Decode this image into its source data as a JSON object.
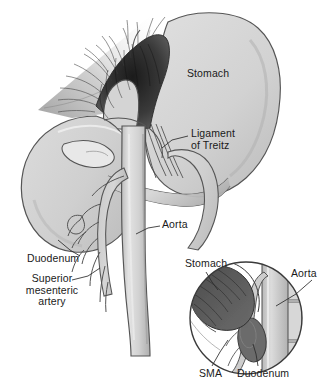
{
  "figure": {
    "width": 332,
    "height": 389,
    "background_color": "#ffffff"
  },
  "palette": {
    "outline": "#4a4a4a",
    "organ_fill_light": "#d9d9d9",
    "organ_fill_mid": "#c9c9c9",
    "organ_fill_dark": "#b5b5b5",
    "vessel_fill": "#cfcfcf",
    "vessel_shadow": "#a9a9a9",
    "inset_dark_stomach": "#595959",
    "inset_dark_duodenum": "#6e6e6e",
    "hatch_line": "#3a3a3a",
    "label_text": "#1a1a1a",
    "leader_line": "#2b2b2b"
  },
  "main_view": {
    "labels": [
      {
        "id": "stomach",
        "text": "Stomach",
        "lines": [
          "Stomach"
        ],
        "x": 187,
        "y": 68,
        "has_leader": false
      },
      {
        "id": "ligament",
        "text": "Ligament of Treitz",
        "lines": [
          "Ligament",
          "of Treitz"
        ],
        "x": 191,
        "y": 128,
        "has_leader": true
      },
      {
        "id": "aorta",
        "text": "Aorta",
        "lines": [
          "Aorta"
        ],
        "x": 162,
        "y": 219,
        "has_leader": true
      },
      {
        "id": "duodenum",
        "text": "Duodenum",
        "lines": [
          "Duodenum"
        ],
        "x": 27,
        "y": 253,
        "has_leader": true
      },
      {
        "id": "sma",
        "text": "Superior mesenteric artery",
        "lines": [
          "Superior",
          "mesenteric",
          "artery"
        ],
        "x": 21,
        "y": 273,
        "has_leader": true
      }
    ],
    "structures": [
      "stomach",
      "esophagus",
      "diaphragm-crus",
      "esophageal-hiatus",
      "duodenum",
      "aorta",
      "superior-mesenteric-artery",
      "ligament-of-treitz-fibers"
    ]
  },
  "inset_view": {
    "shape": "circle",
    "center_x": 246,
    "center_y": 318,
    "radius": 57,
    "labels": [
      {
        "id": "stomach",
        "text": "Stomach",
        "x": 185,
        "y": 258,
        "has_leader": true
      },
      {
        "id": "aorta",
        "text": "Aorta",
        "x": 291,
        "y": 268,
        "has_leader": true
      },
      {
        "id": "sma",
        "text": "SMA",
        "x": 199,
        "y": 368,
        "has_leader": true
      },
      {
        "id": "duodenum",
        "text": "Duodenum",
        "x": 237,
        "y": 368,
        "has_leader": true
      }
    ],
    "structures": [
      "stomach-cross-section",
      "aorta-cross-section",
      "duodenum-compressed",
      "superior-mesenteric-artery",
      "vertebral-bodies"
    ]
  }
}
